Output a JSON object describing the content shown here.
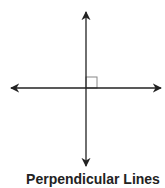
{
  "caption": "Perpendicular Lines",
  "diagram": {
    "type": "perpendicular-lines",
    "horizontal_line": {
      "x1": 11,
      "x2": 161,
      "y": 88,
      "arrows": "both"
    },
    "vertical_line": {
      "x": 86,
      "y1": 12,
      "y2": 166,
      "arrows": "both"
    },
    "right_angle_marker": {
      "x": 86,
      "y": 77,
      "size": 11
    },
    "colors": {
      "line": "#222222",
      "marker": "#888888",
      "background": "#ffffff"
    }
  }
}
